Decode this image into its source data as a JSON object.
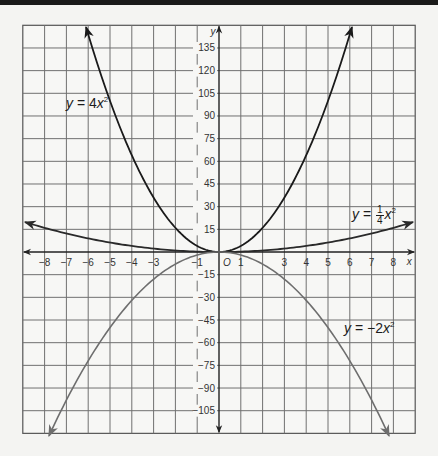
{
  "chart_data": {
    "type": "line",
    "title": "",
    "xlabel": "x",
    "ylabel": "y",
    "origin_label": "O",
    "xlim": [
      -9,
      9
    ],
    "ylim": [
      -120,
      150
    ],
    "grid": true,
    "x_ticks": [
      -8,
      -7,
      -6,
      -5,
      -4,
      -3,
      -1,
      1,
      3,
      4,
      5,
      6,
      7,
      8
    ],
    "y_ticks": [
      135,
      120,
      105,
      90,
      75,
      60,
      45,
      30,
      15,
      -15,
      -30,
      -45,
      -60,
      -75,
      -90,
      -105
    ],
    "series": [
      {
        "name": "y = 4x^2",
        "label_text": {
          "lhs": "y",
          "eq": " = 4",
          "var": "x",
          "exp": "2"
        },
        "coef": 4,
        "x_range": [
          -6.1,
          6.1
        ],
        "color": "#1a1a1a",
        "points": [
          [
            -6,
            144
          ],
          [
            -5,
            100
          ],
          [
            -4,
            64
          ],
          [
            -3,
            36
          ],
          [
            -2,
            16
          ],
          [
            -1,
            4
          ],
          [
            0,
            0
          ],
          [
            1,
            4
          ],
          [
            2,
            16
          ],
          [
            3,
            36
          ],
          [
            4,
            64
          ],
          [
            5,
            100
          ],
          [
            6,
            144
          ]
        ]
      },
      {
        "name": "y = (1/4)x^2",
        "label_text": {
          "lhs": "y",
          "eq": " = ",
          "num": "1",
          "den": "4",
          "var": "x",
          "exp": "2"
        },
        "coef": 0.25,
        "x_range": [
          -8.9,
          8.9
        ],
        "color": "#2a2a2a",
        "points": [
          [
            -8,
            16
          ],
          [
            -6,
            9
          ],
          [
            -4,
            4
          ],
          [
            -2,
            1
          ],
          [
            0,
            0
          ],
          [
            2,
            1
          ],
          [
            4,
            4
          ],
          [
            6,
            9
          ],
          [
            8,
            16
          ]
        ]
      },
      {
        "name": "y = -2x^2",
        "label_text": {
          "lhs": "y",
          "eq": " = −2",
          "var": "x",
          "exp": "2"
        },
        "coef": -2,
        "x_range": [
          -7.8,
          7.8
        ],
        "color": "#6e6e6e",
        "points": [
          [
            -7.75,
            -120
          ],
          [
            -6,
            -72
          ],
          [
            -4,
            -32
          ],
          [
            -2,
            -8
          ],
          [
            0,
            0
          ],
          [
            2,
            -8
          ],
          [
            4,
            -32
          ],
          [
            6,
            -72
          ],
          [
            7.75,
            -120
          ]
        ]
      }
    ],
    "legend_position": "inline labels on curves"
  }
}
